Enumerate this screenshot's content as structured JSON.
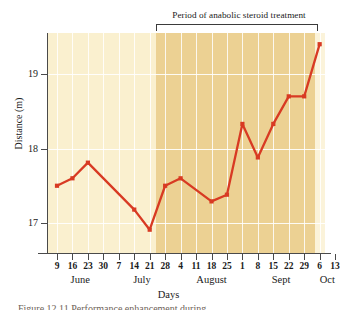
{
  "figure": {
    "annotation_title": "Period of anabolic steroid treatment",
    "caption": "Figure 12.11  Performance enhancement during"
  },
  "axes": {
    "y_title": "Distance (m)",
    "x_title": "Days",
    "y_ticks": [
      17,
      18,
      19
    ],
    "month_labels": [
      "June",
      "July",
      "August",
      "Sept",
      "Oct"
    ]
  },
  "chart_data": {
    "type": "line",
    "title": "Period of anabolic steroid treatment",
    "xlabel": "Days",
    "ylabel": "Distance (m)",
    "ylim": [
      16.55,
      19.65
    ],
    "yticks": [
      17,
      18,
      19
    ],
    "grid": true,
    "legend": "none",
    "line_color": "#d83a23",
    "marker": "square",
    "tick_labels": [
      "9",
      "16",
      "23",
      "30",
      "7",
      "14",
      "21",
      "28",
      "4",
      "11",
      "18",
      "25",
      "1",
      "8",
      "15",
      "22",
      "29",
      "6",
      "13"
    ],
    "months": [
      {
        "label": "June",
        "start_index": 0,
        "end_index": 3
      },
      {
        "label": "July",
        "start_index": 4,
        "end_index": 7
      },
      {
        "label": "August",
        "start_index": 8,
        "end_index": 12
      },
      {
        "label": "Sept",
        "start_index": 13,
        "end_index": 16
      },
      {
        "label": "Oct",
        "start_index": 17,
        "end_index": 18
      }
    ],
    "treatment_period": {
      "label": "Period of anabolic steroid treatment",
      "start_tick": "28",
      "start_index": 7,
      "end_tick": "13",
      "end_index": 18,
      "shaded": true,
      "shade_color": "#ecd193"
    },
    "background_color_before": "#faf0cf",
    "background_color_during": "#ecd193",
    "points": [
      {
        "x_index": 0,
        "tick": "9",
        "month": "June",
        "y": 17.5,
        "marker": true
      },
      {
        "x_index": 1,
        "tick": "16",
        "month": "June",
        "y": 17.6,
        "marker": true
      },
      {
        "x_index": 2,
        "tick": "23",
        "month": "June",
        "y": 17.81,
        "marker": true
      },
      {
        "x_index": 5,
        "tick": "14",
        "month": "July",
        "y": 17.18,
        "marker": true
      },
      {
        "x_index": 6,
        "tick": "21",
        "month": "July",
        "y": 16.91,
        "marker": true
      },
      {
        "x_index": 7,
        "tick": "28",
        "month": "July",
        "y": 17.5,
        "marker": true
      },
      {
        "x_index": 8,
        "tick": "4",
        "month": "August",
        "y": 17.6,
        "marker": true
      },
      {
        "x_index": 10,
        "tick": "18",
        "month": "August",
        "y": 17.29,
        "marker": true
      },
      {
        "x_index": 11,
        "tick": "25",
        "month": "August",
        "y": 17.38,
        "marker": true
      },
      {
        "x_index": 12,
        "tick": "1",
        "month": "August",
        "y": 18.33,
        "marker": true
      },
      {
        "x_index": 13,
        "tick": "8",
        "month": "Sept",
        "y": 17.88,
        "marker": true
      },
      {
        "x_index": 14,
        "tick": "15",
        "month": "Sept",
        "y": 18.33,
        "marker": true
      },
      {
        "x_index": 15,
        "tick": "22",
        "month": "Sept",
        "y": 18.7,
        "marker": true
      },
      {
        "x_index": 16,
        "tick": "29",
        "month": "Sept",
        "y": 18.7,
        "marker": true
      },
      {
        "x_index": 17,
        "tick": "6",
        "month": "Oct",
        "y": 19.4,
        "marker": true
      }
    ]
  }
}
